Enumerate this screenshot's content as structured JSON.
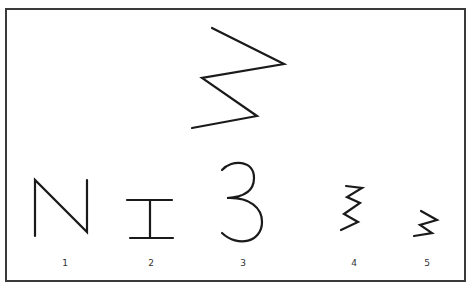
{
  "figure": {
    "top_stimulus": {
      "name": "zigzag-large",
      "points": [
        [
          212,
          28
        ],
        [
          284,
          64
        ],
        [
          202,
          78
        ],
        [
          257,
          116
        ],
        [
          192,
          128
        ]
      ]
    },
    "options": [
      {
        "label": "1",
        "shape": "N",
        "label_x": 65
      },
      {
        "label": "2",
        "shape": "I-beam",
        "label_x": 151
      },
      {
        "label": "3",
        "shape": "3",
        "label_x": 243
      },
      {
        "label": "4",
        "shape": "tight-zigzag",
        "label_x": 354
      },
      {
        "label": "5",
        "shape": "small-zigzag",
        "label_x": 427
      }
    ],
    "stroke_color": "#1a1a1a",
    "border_color": "#3a3a3a"
  }
}
